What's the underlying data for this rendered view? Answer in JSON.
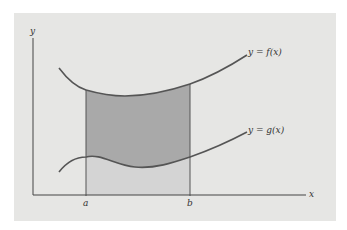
{
  "diagram": {
    "type": "area-between-curves",
    "axis_labels": {
      "x": "x",
      "y": "y"
    },
    "curve_labels": {
      "upper": "y = f(x)",
      "lower": "y = g(x)"
    },
    "bounds": {
      "left": "a",
      "right": "b"
    },
    "colors": {
      "background": "#e6e6e4",
      "region_between": "#a9a9a9",
      "region_below_g": "#d4d4d4",
      "curve": "#555555",
      "axis": "#444444"
    }
  }
}
